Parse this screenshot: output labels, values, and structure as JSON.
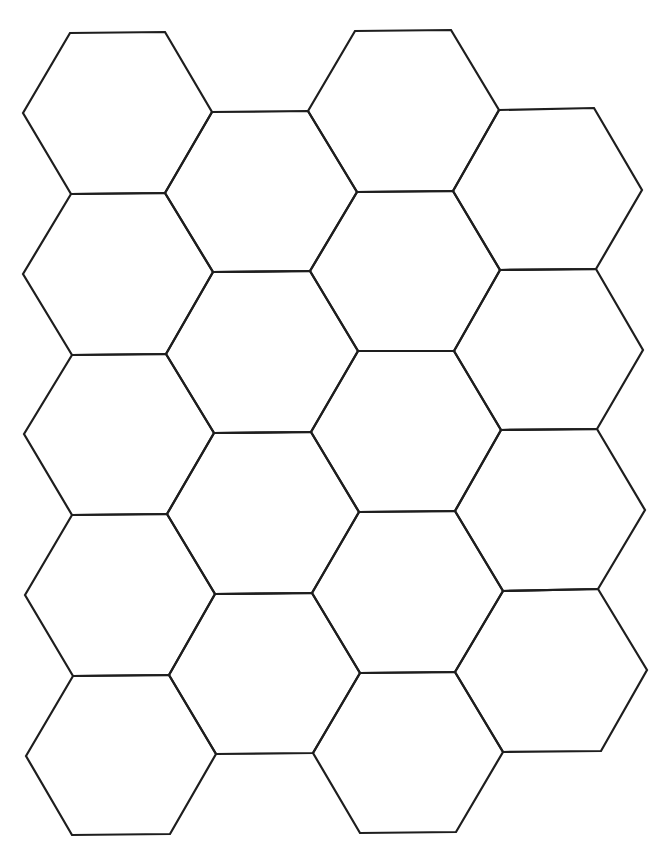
{
  "figure": {
    "type": "hexagon-grid",
    "orientation": "flat-top",
    "columns": 4,
    "line_color": "#1e1e1e",
    "background": "#ffffff",
    "stroke_width": 2.2
  },
  "hexagons": [
    {
      "col": 1,
      "row": 1,
      "points": "23,113 70,33 165,32 212,112 165,193 71,194"
    },
    {
      "col": 1,
      "row": 2,
      "points": "23,274 71,194 165,193 213,272 166,354 72,355"
    },
    {
      "col": 1,
      "row": 3,
      "points": "24,434 72,355 166,354 214,433 167,514 72,515"
    },
    {
      "col": 1,
      "row": 4,
      "points": "25,595 72,515 167,514 215,594 169,675 73,676"
    },
    {
      "col": 1,
      "row": 5,
      "points": "26,756 73,676 169,675 216,754 170,834 72,835"
    },
    {
      "col": 2,
      "row": 1,
      "points": "165,193 212,112 308,111 357,192 310,271 213,272"
    },
    {
      "col": 2,
      "row": 2,
      "points": "166,354 213,272 310,271 358,351 311,432 214,433"
    },
    {
      "col": 2,
      "row": 3,
      "points": "167,514 214,433 311,432 359,512 312,593 215,594"
    },
    {
      "col": 2,
      "row": 4,
      "points": "169,675 215,594 312,593 360,673 313,753 216,754"
    },
    {
      "col": 3,
      "row": 1,
      "points": "308,111 355,31 451,30 499,110 453,191 357,192"
    },
    {
      "col": 3,
      "row": 2,
      "points": "310,271 357,192 453,191 500,270 454,351 358,351"
    },
    {
      "col": 3,
      "row": 3,
      "points": "311,432 358,351 454,351 501,430 455,511 359,512"
    },
    {
      "col": 3,
      "row": 4,
      "points": "312,593 359,512 455,511 503,591 455,672 360,673"
    },
    {
      "col": 3,
      "row": 5,
      "points": "313,753 360,673 455,672 503,752 456,832 360,833"
    },
    {
      "col": 4,
      "row": 1,
      "points": "453,191 499,110 594,108 642,190 596,269 500,270"
    },
    {
      "col": 4,
      "row": 2,
      "points": "454,351 500,270 596,269 643,350 597,429 501,430"
    },
    {
      "col": 4,
      "row": 3,
      "points": "455,511 501,430 597,429 645,510 598,589 503,591"
    },
    {
      "col": 4,
      "row": 4,
      "points": "455,672 503,591 598,589 647,670 601,751 503,752"
    }
  ]
}
